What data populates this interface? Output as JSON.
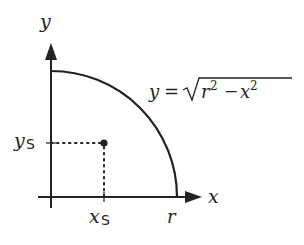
{
  "diagram": {
    "axes": {
      "x_label": "x",
      "y_label": "y"
    },
    "curve": {
      "equation_lhs": "y",
      "equation_eq": "=",
      "equation_r": "r",
      "equation_r_exp": "2",
      "equation_minus": "−",
      "equation_x": "x",
      "equation_x_exp": "2",
      "endpoint_label": "r"
    },
    "point": {
      "x_label_main": "x",
      "x_label_sub": "S",
      "y_label_main": "y",
      "y_label_sub": "S"
    },
    "colors": {
      "stroke": "#222222",
      "background": "#ffffff"
    }
  }
}
